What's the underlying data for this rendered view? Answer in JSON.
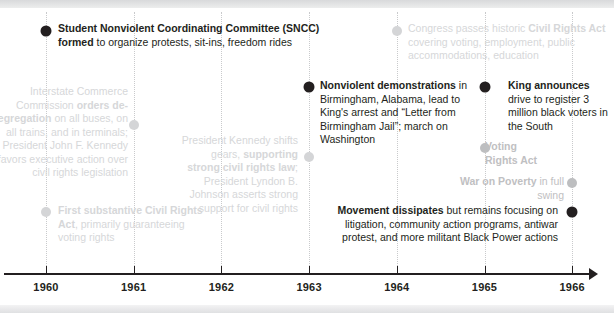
{
  "figure": {
    "name": "civil-rights-movement-timeline",
    "axis": {
      "years": [
        "1960",
        "1961",
        "1962",
        "1963",
        "1964",
        "1965",
        "1966"
      ]
    },
    "colors": {
      "ink": "#231f20",
      "faded_mid": "#bfc0c2",
      "faded_light": "#d6d7d9",
      "gridline": "#c9cacc",
      "background": "#ffffff"
    }
  },
  "events": [
    {
      "id": "sncc-formed",
      "year": "1960",
      "emphasis": "dark",
      "align": "left",
      "bold": "Student Nonviolent Coordinating Committee (SNCC) formed",
      "rest": " to organize protests, sit-ins, freedom rides"
    },
    {
      "id": "icc-orders-desegregation",
      "year": "1961",
      "emphasis": "light",
      "align": "right",
      "lead": "Interstate Commerce Commission ",
      "bold": "orders de-segregation",
      "rest": " on all buses, on all trains, and in terminals; President John F. Kennedy favors executive action over civil rights legislation"
    },
    {
      "id": "first-substantive-civil-rights-act",
      "year": "1960",
      "emphasis": "light",
      "align": "left",
      "bold": "First substantive Civil Rights Act",
      "rest": ", primarily guaranteeing voting rights"
    },
    {
      "id": "kennedy-shifts-gears",
      "year": "1963",
      "emphasis": "light",
      "align": "right",
      "lead": "President Kennedy shifts gears, ",
      "bold": "supporting strong civil rights law",
      "rest": "; President Lyndon B. Johnson asserts strong support for civil rights"
    },
    {
      "id": "nonviolent-demonstrations",
      "year": "1963",
      "emphasis": "dark",
      "align": "left",
      "bold": "Nonviolent demonstrations",
      "rest": " in Birmingham, Alabama, lead to King's arrest and “Letter from Birmingham Jail”; march on Washington"
    },
    {
      "id": "congress-passes-civil-rights-act",
      "year": "1964",
      "emphasis": "light",
      "align": "left",
      "lead": "Congress passes historic ",
      "bold": "Civil Rights Act",
      "rest": " covering voting, employment, public accommodations, education"
    },
    {
      "id": "king-announces-voter-drive",
      "year": "1965",
      "emphasis": "dark",
      "align": "left",
      "bold": "King announces",
      "rest": " drive to register 3 million black voters in the South"
    },
    {
      "id": "voting-rights-act",
      "year": "1965",
      "emphasis": "mid",
      "align": "left",
      "bold": "Voting Rights Act",
      "rest": ""
    },
    {
      "id": "war-on-poverty",
      "year": "1966",
      "emphasis": "mid",
      "align": "right",
      "bold": "War on Poverty",
      "rest": " in full swing"
    },
    {
      "id": "movement-dissipates",
      "year": "1966",
      "emphasis": "dark",
      "align": "right",
      "bold": "Movement dissipates",
      "rest": " but remains focusing on litigation, community action programs, antiwar protest, and more militant Black Power actions"
    }
  ]
}
